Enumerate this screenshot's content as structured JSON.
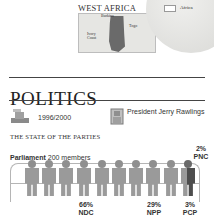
{
  "map": {
    "title": "WEST AFRICA",
    "labels": {
      "north": "Burkina",
      "east": "Togo",
      "west": "Ivory Coast"
    },
    "globe_label": "Africa"
  },
  "section": {
    "title": "POLITICS",
    "election_years": "1996/2000",
    "leader": "President Jerry Rawlings",
    "subheading": "THE STATE OF THE PARTIES"
  },
  "parliament": {
    "label_bold": "Parliament",
    "label_rest": "200 members",
    "total_members": 200,
    "figures_count": 10,
    "parties": [
      {
        "name": "NDC",
        "percent": "66%"
      },
      {
        "name": "NPP",
        "percent": "29%"
      },
      {
        "name": "PCP",
        "percent": "3%"
      },
      {
        "name": "PNC",
        "percent": "2%"
      }
    ]
  },
  "colors": {
    "figure": "#9a9a9a",
    "highlight": "#4d4d4d",
    "ghana": "#6a6a6a"
  }
}
